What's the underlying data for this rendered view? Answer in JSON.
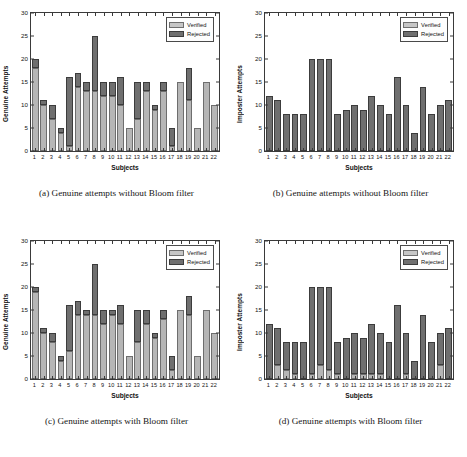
{
  "figure": {
    "axis": {
      "yticks": [
        0,
        5,
        10,
        15,
        20,
        25,
        30
      ],
      "ylim": [
        0,
        30
      ],
      "xlabel": "Subjects",
      "categories": [
        "1",
        "2",
        "3",
        "4",
        "5",
        "6",
        "7",
        "8",
        "9",
        "10",
        "11",
        "12",
        "13",
        "14",
        "15",
        "16",
        "17",
        "18",
        "19",
        "20",
        "21",
        "22"
      ]
    },
    "legend": {
      "verified": "Verified",
      "rejected": "Rejected"
    },
    "colors": {
      "verified": "#b6b6b6",
      "rejected": "#6f6f6f",
      "axis": "#3a3a3a",
      "background": "#ffffff"
    }
  },
  "chart_data": [
    {
      "id": "a",
      "type": "bar",
      "stacked": true,
      "caption": "(a) Genuine attempts without Bloom filter",
      "title": "",
      "xlabel": "Subjects",
      "ylabel": "Genuine Attempts",
      "ylim": [
        0,
        30
      ],
      "yticks": [
        0,
        5,
        10,
        15,
        20,
        25,
        30
      ],
      "grid": false,
      "legend_position": "top-right",
      "categories": [
        "1",
        "2",
        "3",
        "4",
        "5",
        "6",
        "7",
        "8",
        "9",
        "10",
        "11",
        "12",
        "13",
        "14",
        "15",
        "16",
        "17",
        "18",
        "19",
        "20",
        "21",
        "22"
      ],
      "series": [
        {
          "name": "Verified",
          "values": [
            18,
            10,
            7,
            4,
            1,
            14,
            13,
            13,
            12,
            12,
            10,
            5,
            7,
            13,
            9,
            13,
            1,
            15,
            11,
            5,
            15,
            10
          ]
        },
        {
          "name": "Rejected",
          "values": [
            2,
            1,
            3,
            1,
            15,
            3,
            2,
            12,
            3,
            3,
            6,
            0,
            8,
            2,
            1,
            2,
            4,
            0,
            7,
            0,
            0,
            0
          ]
        }
      ],
      "totals": [
        20,
        11,
        10,
        5,
        16,
        17,
        15,
        25,
        15,
        15,
        16,
        5,
        15,
        15,
        10,
        15,
        5,
        15,
        18,
        5,
        15,
        10
      ]
    },
    {
      "id": "b",
      "type": "bar",
      "stacked": true,
      "caption": "(b) Genuine attempts without Bloom filter",
      "title": "",
      "xlabel": "Subjects",
      "ylabel": "Imposter Attempts",
      "ylim": [
        0,
        30
      ],
      "yticks": [
        0,
        5,
        10,
        15,
        20,
        25,
        30
      ],
      "grid": false,
      "legend_position": "top-right",
      "categories": [
        "1",
        "2",
        "3",
        "4",
        "5",
        "6",
        "7",
        "8",
        "9",
        "10",
        "11",
        "12",
        "13",
        "14",
        "15",
        "16",
        "17",
        "18",
        "19",
        "20",
        "21",
        "22"
      ],
      "series": [
        {
          "name": "Verified",
          "values": [
            0,
            0,
            0,
            0,
            0,
            0,
            0,
            0,
            0,
            0,
            0,
            0,
            0,
            0,
            0,
            0,
            0,
            0,
            0,
            0,
            0,
            0
          ]
        },
        {
          "name": "Rejected",
          "values": [
            12,
            11,
            8,
            8,
            8,
            20,
            20,
            20,
            8,
            9,
            10,
            9,
            12,
            10,
            8,
            16,
            10,
            4,
            14,
            8,
            10,
            11
          ]
        }
      ],
      "totals": [
        12,
        11,
        8,
        8,
        8,
        20,
        20,
        20,
        8,
        9,
        10,
        9,
        12,
        10,
        8,
        16,
        10,
        4,
        14,
        8,
        10,
        11
      ]
    },
    {
      "id": "c",
      "type": "bar",
      "stacked": true,
      "caption": "(c) Genuine attempts with Bloom filter",
      "title": "",
      "xlabel": "Subjects",
      "ylabel": "Genuine Attempts",
      "ylim": [
        0,
        30
      ],
      "yticks": [
        0,
        5,
        10,
        15,
        20,
        25,
        30
      ],
      "grid": false,
      "legend_position": "top-right",
      "categories": [
        "1",
        "2",
        "3",
        "4",
        "5",
        "6",
        "7",
        "8",
        "9",
        "10",
        "11",
        "12",
        "13",
        "14",
        "15",
        "16",
        "17",
        "18",
        "19",
        "20",
        "21",
        "22"
      ],
      "series": [
        {
          "name": "Verified",
          "values": [
            19,
            10,
            8,
            4,
            6,
            14,
            14,
            14,
            12,
            14,
            12,
            5,
            8,
            12,
            9,
            13,
            2,
            15,
            14,
            5,
            15,
            10
          ]
        },
        {
          "name": "Rejected",
          "values": [
            1,
            1,
            2,
            1,
            10,
            3,
            1,
            11,
            3,
            1,
            4,
            0,
            7,
            3,
            1,
            2,
            3,
            0,
            4,
            0,
            0,
            0
          ]
        }
      ],
      "totals": [
        20,
        11,
        10,
        5,
        16,
        17,
        15,
        25,
        15,
        15,
        16,
        5,
        15,
        15,
        10,
        15,
        5,
        15,
        18,
        5,
        15,
        10
      ]
    },
    {
      "id": "d",
      "type": "bar",
      "stacked": true,
      "caption": "(d) Genuine attempts with Bloom filter",
      "title": "",
      "xlabel": "Subjects",
      "ylabel": "Imposter Attempts",
      "ylim": [
        0,
        30
      ],
      "yticks": [
        0,
        5,
        10,
        15,
        20,
        25,
        30
      ],
      "grid": false,
      "legend_position": "top-right",
      "categories": [
        "1",
        "2",
        "3",
        "4",
        "5",
        "6",
        "7",
        "8",
        "9",
        "10",
        "11",
        "12",
        "13",
        "14",
        "15",
        "16",
        "17",
        "18",
        "19",
        "20",
        "21",
        "22"
      ],
      "series": [
        {
          "name": "Verified",
          "values": [
            0,
            3,
            2,
            1,
            0,
            1,
            3,
            2,
            1,
            0,
            1,
            1,
            1,
            1,
            0,
            0,
            1,
            0,
            0,
            0,
            3,
            0
          ]
        },
        {
          "name": "Rejected",
          "values": [
            12,
            8,
            6,
            7,
            8,
            19,
            17,
            18,
            7,
            9,
            9,
            8,
            11,
            9,
            8,
            16,
            9,
            4,
            14,
            8,
            7,
            11
          ]
        }
      ],
      "totals": [
        12,
        11,
        8,
        8,
        8,
        20,
        20,
        20,
        8,
        9,
        10,
        9,
        12,
        10,
        8,
        16,
        10,
        4,
        14,
        8,
        10,
        11
      ]
    }
  ]
}
